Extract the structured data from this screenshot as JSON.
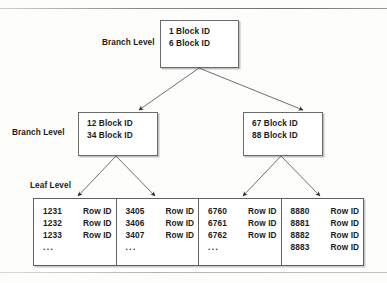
{
  "diagram": {
    "levels": {
      "root_label": "Branch Level",
      "branch_label": "Branch Level",
      "leaf_label": "Leaf Level"
    },
    "root": {
      "entries": [
        "1 Block ID",
        "6 Block ID"
      ]
    },
    "branches": [
      {
        "entries": [
          "12 Block ID",
          "34 Block ID"
        ]
      },
      {
        "entries": [
          "67 Block ID",
          "88 Block ID"
        ]
      }
    ],
    "leaves": [
      {
        "rows": [
          {
            "key": "1231",
            "value": "Row ID"
          },
          {
            "key": "1232",
            "value": "Row ID"
          },
          {
            "key": "1233",
            "value": "Row ID"
          },
          {
            "key": "...",
            "value": ""
          }
        ]
      },
      {
        "rows": [
          {
            "key": "3405",
            "value": "Row ID"
          },
          {
            "key": "3406",
            "value": "Row ID"
          },
          {
            "key": "3407",
            "value": "Row ID"
          },
          {
            "key": "...",
            "value": ""
          }
        ]
      },
      {
        "rows": [
          {
            "key": "6760",
            "value": "Row ID"
          },
          {
            "key": "6761",
            "value": "Row ID"
          },
          {
            "key": "6762",
            "value": "Row ID"
          },
          {
            "key": "...",
            "value": ""
          }
        ]
      },
      {
        "rows": [
          {
            "key": "8880",
            "value": "Row ID"
          },
          {
            "key": "8881",
            "value": "Row ID"
          },
          {
            "key": "8882",
            "value": "Row ID"
          },
          {
            "key": "8883",
            "value": "Row ID"
          }
        ]
      }
    ],
    "colors": {
      "box_border": "#6b6b6b",
      "text": "#1b1b1b",
      "arrow": "#3d3d3d",
      "background": "#fdfdfc"
    }
  }
}
